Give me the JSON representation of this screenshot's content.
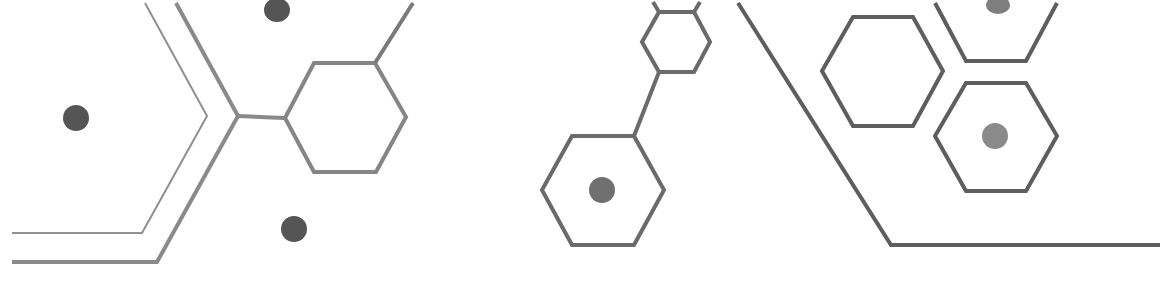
{
  "graphic": {
    "background": "#ffffff",
    "colors": {
      "light_line": "#8a8a8a",
      "mid_line": "#7a7a7a",
      "dark_line": "#5e5e5e",
      "dark_dot": "#555555",
      "light_dot": "#8a8a8a"
    },
    "elements": [
      "chevron-lines-left",
      "hexagon-connected-left",
      "dots-left",
      "hexagon-small-top-center",
      "hexagon-large-center-with-dot",
      "diagonal-baseline-right",
      "hexagon-cluster-right"
    ]
  }
}
